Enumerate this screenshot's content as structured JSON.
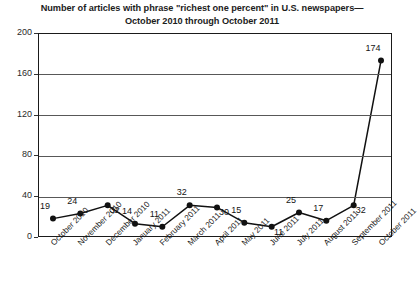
{
  "chart_data": {
    "type": "line",
    "title_lines": [
      "Number of articles with phrase \"richest one percent\" in U.S. newspapers—",
      "October 2010 through October 2011"
    ],
    "xlabel": "",
    "ylabel": "",
    "categories": [
      "October 2010",
      "November 2010",
      "December 2010",
      "January 2011",
      "February 2011",
      "March 2011",
      "April 2011",
      "May 2011",
      "June 2011",
      "July 2011",
      "August 2011",
      "September 2011",
      "October 2011"
    ],
    "values": [
      19,
      24,
      32,
      14,
      11,
      32,
      30,
      15,
      11,
      25,
      17,
      32,
      174
    ],
    "point_labels": [
      "19",
      "24",
      "32",
      "14",
      "11",
      "32",
      "30",
      "15",
      "11",
      "25",
      "17",
      "32",
      "174"
    ],
    "label_positions": [
      "above",
      "above",
      "below",
      "above",
      "above",
      "above",
      "below",
      "above",
      "below",
      "above",
      "above",
      "below",
      "above"
    ],
    "ylim": [
      0,
      200
    ],
    "ytick_labels": [
      "0",
      "40",
      "80",
      "120",
      "160",
      "200"
    ],
    "ytick_values": [
      0,
      40,
      80,
      120,
      160,
      200
    ],
    "grid": "horizontal",
    "legend": "none",
    "line_color": "#111111",
    "marker_color": "#111111",
    "marker_shape": "circle",
    "background_color": "#ffffff"
  }
}
